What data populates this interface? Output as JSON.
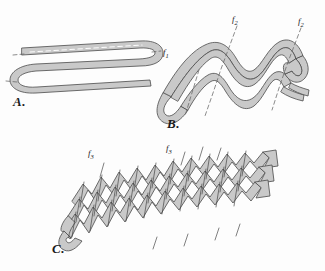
{
  "figure": {
    "background_color": "#fdfdfd",
    "band_fill": "#c9c9c9",
    "band_stroke": "#4a4a4a",
    "trace_color": "#555555",
    "label_color": "#1a1a1a"
  },
  "panels": [
    {
      "id": "A",
      "caption": "A.",
      "description": "Isoclinal hairpin fold of a single gray band with dashed axial traces",
      "labels": [
        {
          "id": "f1",
          "text": "f",
          "sub": "1"
        }
      ]
    },
    {
      "id": "B",
      "caption": "B.",
      "description": "Refolded hairpin band forming nested sinusoidal second-generation folds",
      "labels": [
        {
          "id": "f2a",
          "text": "f",
          "sub": "2"
        },
        {
          "id": "f2b",
          "text": "f",
          "sub": "2"
        }
      ]
    },
    {
      "id": "C",
      "caption": "C.",
      "description": "Tightly crenulated chevron refold with numerous third-generation axial planes",
      "labels": [
        {
          "id": "f3a",
          "text": "f",
          "sub": "3"
        },
        {
          "id": "f3b",
          "text": "f",
          "sub": "3"
        }
      ]
    }
  ]
}
